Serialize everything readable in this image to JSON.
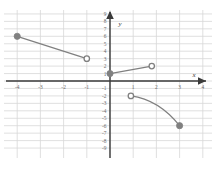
{
  "figure": {
    "background_color": "#ffffff",
    "grid_color": "#d8d8d8",
    "grid_minor_color": "#e9e9e9",
    "axis_color": "#3a3a3a",
    "curve_color": "#808080",
    "marker_fill_color": "#808080",
    "marker_open_fill": "#ffffff",
    "x_axis_label": "x",
    "y_axis_label": "y"
  },
  "chart_data": {
    "type": "line",
    "title": "",
    "xlabel": "x",
    "ylabel": "y",
    "xlim": [
      -4.6,
      4.6
    ],
    "ylim": [
      -9.6,
      9.6
    ],
    "grid": true,
    "legend": "none",
    "x_ticks": [
      -4,
      -3,
      -2,
      -1,
      1,
      2,
      3,
      4
    ],
    "x_tick_labels": [
      "-4",
      "-3",
      "-2",
      "-1",
      "1",
      "2",
      "3",
      "4"
    ],
    "y_ticks": [
      9,
      8,
      7,
      6,
      5,
      4,
      3,
      2,
      1,
      -1,
      -2,
      -3,
      -4,
      -5,
      -6,
      -7,
      -8,
      -9
    ],
    "y_tick_labels": [
      "9",
      "8",
      "7",
      "6",
      "5",
      "4",
      "3",
      "2",
      "1",
      "-1",
      "-2",
      "-3",
      "-4",
      "-5",
      "-6",
      "-7",
      "-8",
      "-9"
    ],
    "series": [
      {
        "name": "segment-upper-left",
        "shape": "line",
        "points": [
          [
            -4,
            6
          ],
          [
            -1,
            3
          ]
        ],
        "start_marker": "closed",
        "end_marker": "open"
      },
      {
        "name": "segment-middle",
        "shape": "line",
        "points": [
          [
            0,
            1
          ],
          [
            1.8,
            2
          ]
        ],
        "start_marker": "closed",
        "end_marker": "open"
      },
      {
        "name": "arc-lower-right",
        "shape": "curve",
        "points": [
          [
            0.9,
            -2
          ],
          [
            3,
            -6
          ]
        ],
        "control_point": [
          2.1,
          -2.5
        ],
        "start_marker": "open",
        "end_marker": "closed"
      }
    ],
    "markers": [
      {
        "name": "closed-point-neg4-6",
        "x": -4,
        "y": 6,
        "type": "closed"
      },
      {
        "name": "open-point-neg1-3",
        "x": -1,
        "y": 3,
        "type": "open"
      },
      {
        "name": "closed-point-0-1",
        "x": 0,
        "y": 1,
        "type": "closed"
      },
      {
        "name": "open-point-1p8-2",
        "x": 1.8,
        "y": 2,
        "type": "open"
      },
      {
        "name": "open-point-0p9-neg2",
        "x": 0.9,
        "y": -2,
        "type": "open"
      },
      {
        "name": "closed-point-3-neg6",
        "x": 3,
        "y": -6,
        "type": "closed"
      }
    ]
  }
}
